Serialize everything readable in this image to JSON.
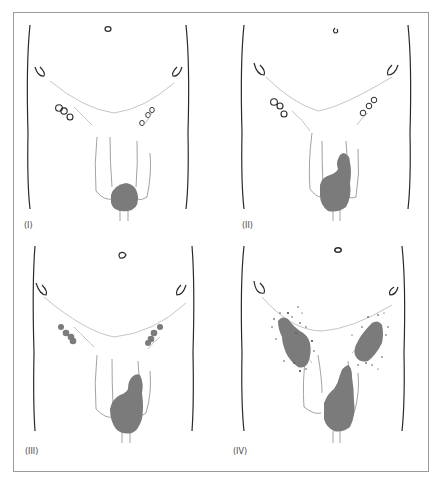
{
  "figure": {
    "panels": [
      {
        "id": "I",
        "label": "(I)",
        "stage": "primary tumour confined to penis, non-palpable nodes"
      },
      {
        "id": "II",
        "label": "(II)",
        "stage": "extended tumour, non-palpable nodes"
      },
      {
        "id": "III",
        "label": "(III)",
        "stage": "palpable mobile inguinal nodes"
      },
      {
        "id": "IV",
        "label": "(IV)",
        "stage": "fixed inguinal nodal masses with spread"
      }
    ],
    "colors": {
      "outline": "#2a2a2a",
      "thin_line": "#b8b8b8",
      "lesion_fill": "#7b7b7b",
      "frame": "#9a9a9a"
    }
  }
}
